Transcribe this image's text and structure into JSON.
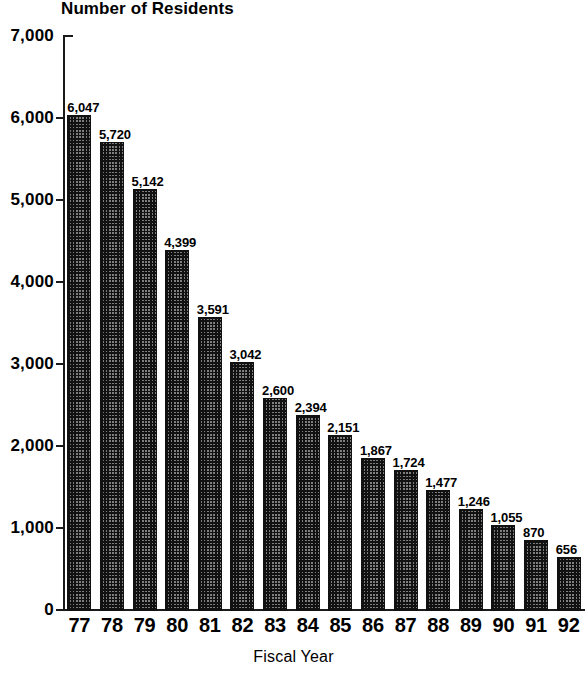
{
  "chart_data": {
    "type": "bar",
    "title": "Number of Residents",
    "xlabel": "Fiscal Year",
    "ylabel": "",
    "ylim": [
      0,
      7000
    ],
    "ytick_values": [
      0,
      1000,
      2000,
      3000,
      4000,
      5000,
      6000,
      7000
    ],
    "ytick_labels": [
      "0",
      "1,000",
      "2,000",
      "3,000",
      "4,000",
      "5,000",
      "6,000",
      "7,000"
    ],
    "grid": false,
    "legend": null,
    "categories": [
      "77",
      "78",
      "79",
      "80",
      "81",
      "82",
      "83",
      "84",
      "85",
      "86",
      "87",
      "88",
      "89",
      "90",
      "91",
      "92"
    ],
    "values": [
      6047,
      5720,
      5142,
      4399,
      3591,
      3042,
      2600,
      2394,
      2151,
      1867,
      1724,
      1477,
      1246,
      1055,
      870,
      656
    ],
    "data_labels": [
      "6,047",
      "5,720",
      "5,142",
      "4,399",
      "3,591",
      "3,042",
      "2,600",
      "2,394",
      "2,151",
      "1,867",
      "1,724",
      "1,477",
      "1,246",
      "1,055",
      "870",
      "656"
    ],
    "bar_fill_pattern": "checkerboard-dither",
    "bar_fill_color": "#7e7e7e",
    "bar_edge_color": "#111111",
    "axis_color": "#1a1a1a",
    "background_color": "#ffffff"
  }
}
